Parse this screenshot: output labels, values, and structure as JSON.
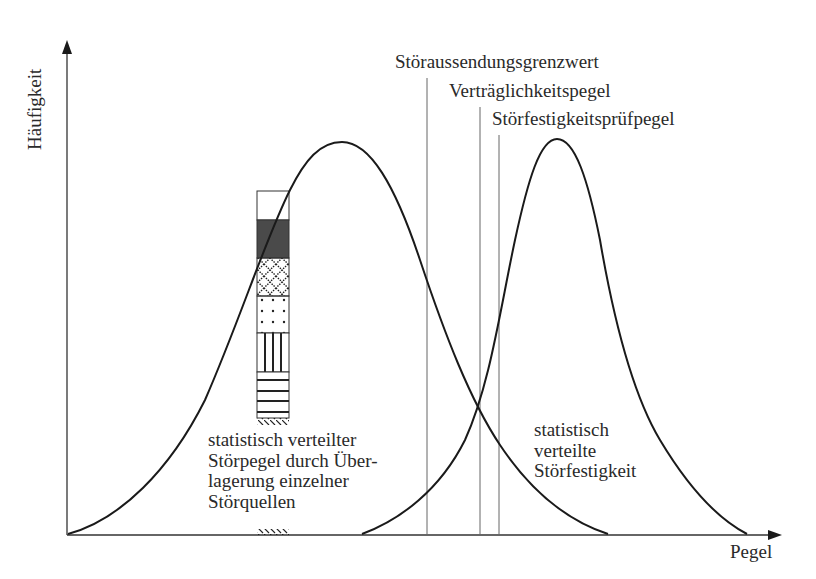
{
  "diagram": {
    "axes": {
      "y_label": "Häufigkeit",
      "x_label": "Pegel"
    },
    "thresholds": [
      {
        "label": "Störaussendungsgrenzwert",
        "x": 427
      },
      {
        "label": "Verträglichkeitspegel",
        "x": 480
      },
      {
        "label": "Störfestigkeitsprüfpegel",
        "x": 499
      }
    ],
    "curves": [
      {
        "name": "disturbance-level-distribution",
        "label_lines": [
          "statistisch verteilter",
          "Störpegel durch Über-",
          "lagerung einzelner",
          "Störquellen"
        ]
      },
      {
        "name": "immunity-distribution",
        "label_lines": [
          "statistisch",
          "verteilte",
          "Störfestigkeit"
        ]
      }
    ],
    "stacked_sources_bar": {
      "segments": [
        "blank",
        "dark-fill",
        "crosshatch",
        "dots",
        "vertical-lines",
        "horizontal-lines",
        "diagonal-ticks"
      ]
    },
    "colors": {
      "line": "#1a1a1a",
      "thin_line": "#555555",
      "dark_fill": "#4a4a4a"
    }
  }
}
